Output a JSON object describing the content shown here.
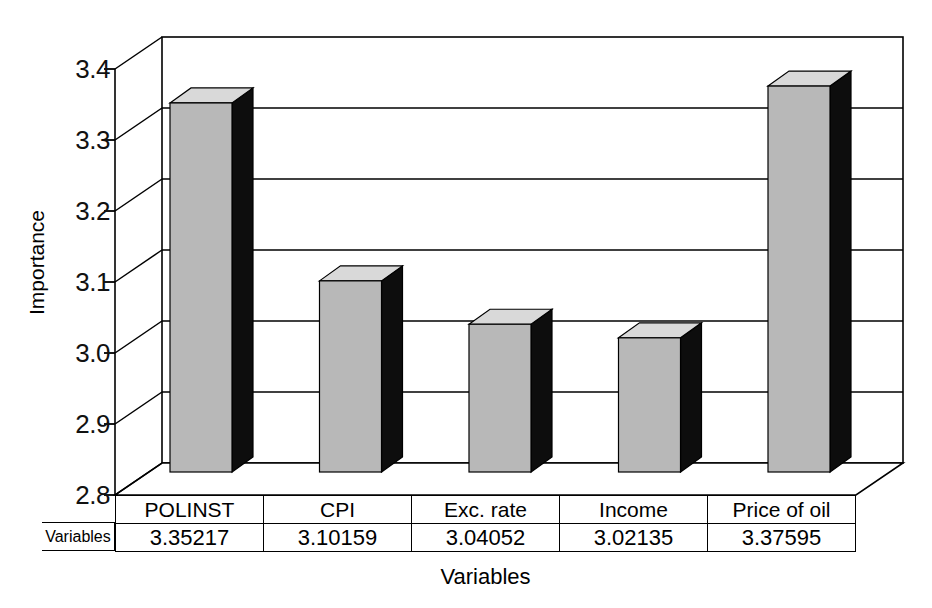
{
  "chart_data": {
    "type": "bar",
    "title": "",
    "subtitle": "",
    "xlabel": "Variables",
    "ylabel": "Importance",
    "categories": [
      "POLINST",
      "CPI",
      "Exc. rate",
      "Income",
      "Price of oil"
    ],
    "values": [
      3.35217,
      3.10159,
      3.04052,
      3.02135,
      3.37595
    ],
    "value_labels": [
      "3.35217",
      "3.10159",
      "3.04052",
      "3.02135",
      "3.37595"
    ],
    "series": [
      {
        "name": "Variables",
        "values": [
          3.35217,
          3.10159,
          3.04052,
          3.02135,
          3.37595
        ]
      }
    ],
    "ylim": [
      2.8,
      3.4
    ],
    "ytick_labels": [
      "3.4",
      "3.3",
      "3.2",
      "3.1",
      "3.0",
      "2.9",
      "2.8"
    ],
    "ytick_values": [
      3.4,
      3.3,
      3.2,
      3.1,
      3.0,
      2.9,
      2.8
    ],
    "grid": true,
    "legend": false,
    "legend_position": "none",
    "style": "3d-column",
    "colors": {
      "bar_front": "#b8b8b8",
      "bar_top": "#d9d9d9",
      "bar_side": "#0d0d0d",
      "axis": "#000000",
      "grid": "#000000",
      "background": "#ffffff"
    }
  },
  "axes": {
    "y_title": "Importance",
    "x_title": "Variables",
    "y_ticks": [
      {
        "label": "3.4",
        "value": 3.4
      },
      {
        "label": "3.3",
        "value": 3.3
      },
      {
        "label": "3.2",
        "value": 3.2
      },
      {
        "label": "3.1",
        "value": 3.1
      },
      {
        "label": "3.0",
        "value": 3.0
      },
      {
        "label": "2.9",
        "value": 2.9
      },
      {
        "label": "2.8",
        "value": 2.8
      }
    ]
  },
  "table": {
    "row_header": "Variables",
    "category_row": [
      "POLINST",
      "CPI",
      "Exc. rate",
      "Income",
      "Price of oil"
    ],
    "value_row": [
      "3.35217",
      "3.10159",
      "3.04052",
      "3.02135",
      "3.37595"
    ]
  }
}
